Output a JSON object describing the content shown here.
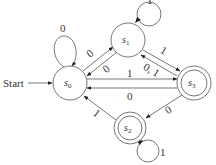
{
  "diagram": {
    "type": "finite-state-machine",
    "start_label": "Start",
    "states": [
      {
        "id": "s0",
        "name": "s",
        "sub": "0",
        "accepting": false,
        "start": true
      },
      {
        "id": "s1",
        "name": "s",
        "sub": "1",
        "accepting": false,
        "start": false
      },
      {
        "id": "s2",
        "name": "s",
        "sub": "2",
        "accepting": true,
        "start": false
      },
      {
        "id": "s3",
        "name": "s",
        "sub": "3",
        "accepting": true,
        "start": false
      }
    ],
    "transitions": [
      {
        "from": "s0",
        "to": "s0",
        "label": "0"
      },
      {
        "from": "s0",
        "to": "s1",
        "label": "0"
      },
      {
        "from": "s1",
        "to": "s0",
        "label": "0"
      },
      {
        "from": "s1",
        "to": "s1",
        "label": "1"
      },
      {
        "from": "s1",
        "to": "s3",
        "label": "1"
      },
      {
        "from": "s3",
        "to": "s1",
        "label": "0, 1"
      },
      {
        "from": "s0",
        "to": "s3",
        "label": "1"
      },
      {
        "from": "s3",
        "to": "s0",
        "label": "0"
      },
      {
        "from": "s3",
        "to": "s2",
        "label": "0"
      },
      {
        "from": "s2",
        "to": "s0",
        "label": "1"
      },
      {
        "from": "s2",
        "to": "s2",
        "label": "1"
      }
    ]
  }
}
